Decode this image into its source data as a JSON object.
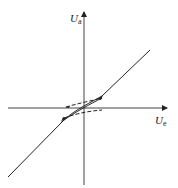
{
  "diagram": {
    "y_axis": {
      "label": "U",
      "subscript": "a"
    },
    "x_axis": {
      "label": "U",
      "subscript": "e"
    },
    "colors": {
      "line": "#222222",
      "background": "#ffffff"
    }
  }
}
